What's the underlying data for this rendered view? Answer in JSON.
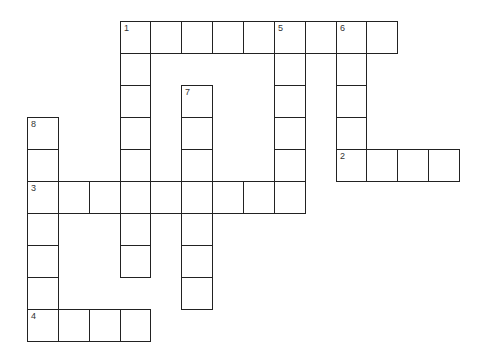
{
  "puzzle": {
    "grid": {
      "origin_x": 27,
      "origin_y": 21,
      "cell_w": 30.86,
      "cell_h": 32,
      "cols": 14,
      "rows": 10
    },
    "entries": [
      {
        "number": "1",
        "direction": "across",
        "col": 3,
        "row": 0,
        "length": 9
      },
      {
        "number": "1",
        "direction": "down",
        "col": 3,
        "row": 0,
        "length": 8
      },
      {
        "number": "5",
        "direction": "down",
        "col": 8,
        "row": 0,
        "length": 6
      },
      {
        "number": "6",
        "direction": "down",
        "col": 10,
        "row": 0,
        "length": 5
      },
      {
        "number": "2",
        "direction": "across",
        "col": 10,
        "row": 4,
        "length": 4
      },
      {
        "number": "7",
        "direction": "down",
        "col": 5,
        "row": 2,
        "length": 7
      },
      {
        "number": "8",
        "direction": "down",
        "col": 0,
        "row": 3,
        "length": 7
      },
      {
        "number": "3",
        "direction": "across",
        "col": 0,
        "row": 5,
        "length": 9
      },
      {
        "number": "4",
        "direction": "across",
        "col": 0,
        "row": 9,
        "length": 4
      }
    ],
    "colors": {
      "border": "#222222",
      "cell_bg": "#ffffff",
      "number": "#333333"
    }
  }
}
